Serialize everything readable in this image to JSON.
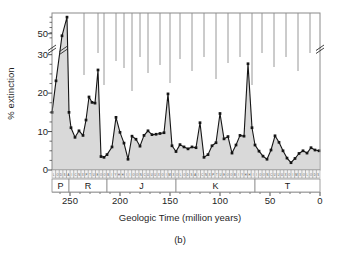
{
  "figure": {
    "caption": "(b)",
    "xlabel": "Geologic Time (million years)",
    "ylabel": "% extinction"
  },
  "chart_data": {
    "type": "line",
    "title": "",
    "subtitle": "",
    "caption": "(b)",
    "xlabel": "Geologic Time (million years)",
    "ylabel": "% extinction",
    "xlim": [
      268,
      0
    ],
    "ylim": [
      0,
      60
    ],
    "x_axis_reversed": true,
    "y_axis_break": {
      "from": 32,
      "to": 46,
      "label": "axis break between 30 and 50"
    },
    "grid": false,
    "legend": "none",
    "xticks": [
      250,
      200,
      150,
      100,
      50,
      0
    ],
    "yticks": [
      0,
      10,
      20,
      30,
      50
    ],
    "marker": "square",
    "line_color": "#151515",
    "fill_color": "#d9d9d9",
    "frame_color": "#8a8a8a",
    "x": [
      268,
      264,
      258,
      253,
      251,
      249,
      245,
      241,
      237,
      234,
      231,
      228,
      225,
      222,
      219,
      216,
      213,
      208,
      204,
      200,
      196,
      192,
      188,
      184,
      180,
      176,
      172,
      168,
      164,
      160,
      156,
      152,
      148,
      144,
      140,
      136,
      132,
      128,
      124,
      120,
      116,
      112,
      108,
      104,
      100,
      96,
      92,
      88,
      84,
      80,
      76,
      72,
      68,
      65,
      61,
      57,
      53,
      49,
      45,
      41,
      37,
      33,
      29,
      25,
      21,
      17,
      13,
      9,
      5,
      1
    ],
    "y": [
      15.0,
      23.2,
      49.0,
      58.0,
      15.0,
      11.0,
      8.5,
      10.2,
      9.0,
      13.0,
      19.0,
      17.6,
      17.4,
      32.5,
      3.5,
      3.3,
      4.0,
      6.0,
      13.7,
      9.8,
      7.0,
      2.8,
      8.8,
      8.0,
      6.2,
      9.0,
      10.2,
      9.2,
      9.3,
      9.5,
      9.7,
      19.8,
      6.3,
      4.8,
      6.6,
      6.0,
      5.5,
      6.0,
      5.8,
      12.3,
      3.3,
      4.0,
      6.3,
      7.1,
      14.7,
      8.1,
      8.7,
      4.4,
      6.5,
      9.0,
      8.8,
      35.5,
      11.0,
      6.5,
      4.9,
      3.6,
      2.8,
      5.2,
      8.9,
      7.2,
      5.0,
      3.1,
      1.9,
      3.0,
      4.3,
      5.0,
      4.4,
      5.8,
      5.2,
      5.0
    ],
    "periods": [
      {
        "symbol": "P",
        "name": "Permian",
        "start": 268,
        "end": 251
      },
      {
        "symbol": "R",
        "name": "Triassic",
        "start": 251,
        "end": 213
      },
      {
        "symbol": "J",
        "name": "Jurassic",
        "start": 213,
        "end": 144
      },
      {
        "symbol": "K",
        "name": "Cretaceous",
        "start": 144,
        "end": 65
      },
      {
        "symbol": "T",
        "name": "Tertiary",
        "start": 65,
        "end": 0
      }
    ],
    "period_boundaries": [
      251,
      213,
      144,
      65
    ],
    "stage_band_note": "row of narrow geologic stage cells with single-letter abbreviations"
  }
}
